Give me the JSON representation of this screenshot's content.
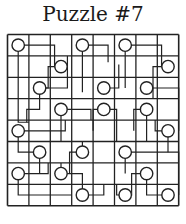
{
  "title": "Puzzle #7",
  "grid": {
    "rows": 8,
    "cols": 8,
    "x0": 7.5,
    "y0": 34.5,
    "cell": 21.4,
    "line_color": "#222222",
    "path_color": "#222222"
  },
  "circles": [
    [
      0,
      0
    ],
    [
      0,
      3
    ],
    [
      0,
      5
    ],
    [
      1,
      2
    ],
    [
      1,
      7
    ],
    [
      2,
      1
    ],
    [
      2,
      4
    ],
    [
      2,
      6
    ],
    [
      3,
      2
    ],
    [
      3,
      4
    ],
    [
      3,
      6
    ],
    [
      4,
      0
    ],
    [
      4,
      7
    ],
    [
      5,
      1
    ],
    [
      5,
      3
    ],
    [
      5,
      5
    ],
    [
      6,
      0
    ],
    [
      6,
      2
    ],
    [
      6,
      6
    ],
    [
      7,
      3
    ],
    [
      7,
      5
    ],
    [
      7,
      7
    ]
  ],
  "paths": [
    [
      [
        0,
        0
      ],
      [
        0,
        1.7
      ],
      [
        1,
        1.7
      ],
      [
        1,
        2
      ]
    ],
    [
      [
        0,
        0
      ],
      [
        3.6,
        0
      ],
      [
        3.6,
        0.5
      ]
    ],
    [
      [
        0,
        3
      ],
      [
        0,
        4.2
      ],
      [
        0.8,
        4.2
      ]
    ],
    [
      [
        0,
        3
      ],
      [
        2.2,
        3
      ]
    ],
    [
      [
        0,
        5
      ],
      [
        0,
        6.7
      ],
      [
        1,
        6.7
      ],
      [
        1,
        7
      ]
    ],
    [
      [
        0,
        5
      ],
      [
        2,
        5
      ]
    ],
    [
      [
        1,
        2
      ],
      [
        1,
        1.4
      ],
      [
        2,
        1.4
      ],
      [
        2,
        1
      ]
    ],
    [
      [
        1,
        7
      ],
      [
        1,
        6.3
      ],
      [
        2.5,
        6.3
      ]
    ],
    [
      [
        2,
        1
      ],
      [
        2,
        2.3
      ],
      [
        0.5,
        2.3
      ]
    ],
    [
      [
        2,
        1
      ],
      [
        3,
        1
      ],
      [
        3,
        0.4
      ],
      [
        3.6,
        0.4
      ]
    ],
    [
      [
        2,
        4
      ],
      [
        2,
        4.7
      ],
      [
        0.9,
        4.7
      ]
    ],
    [
      [
        2,
        6
      ],
      [
        2,
        6.3
      ]
    ],
    [
      [
        2,
        6
      ],
      [
        2,
        7.5
      ],
      [
        4,
        7.5
      ]
    ],
    [
      [
        3,
        2
      ],
      [
        3,
        3.4
      ],
      [
        3.5,
        3.4
      ]
    ],
    [
      [
        3,
        2
      ],
      [
        4.5,
        2
      ]
    ],
    [
      [
        3,
        4
      ],
      [
        3,
        3.5
      ],
      [
        4,
        3.5
      ]
    ],
    [
      [
        3,
        4
      ],
      [
        3,
        4.6
      ],
      [
        4.5,
        4.6
      ]
    ],
    [
      [
        3,
        6
      ],
      [
        3,
        5.4
      ],
      [
        4,
        5.4
      ]
    ],
    [
      [
        3,
        6
      ],
      [
        4.5,
        6
      ]
    ],
    [
      [
        4,
        0
      ],
      [
        4,
        2.2
      ],
      [
        3.5,
        2.2
      ]
    ],
    [
      [
        4,
        0
      ],
      [
        5,
        0
      ],
      [
        5,
        1
      ]
    ],
    [
      [
        4,
        7
      ],
      [
        4,
        6.4
      ],
      [
        3.5,
        6.4
      ]
    ],
    [
      [
        4,
        7
      ],
      [
        5,
        7
      ]
    ],
    [
      [
        5,
        1
      ],
      [
        6,
        1
      ]
    ],
    [
      [
        5,
        3
      ],
      [
        5,
        2.4
      ],
      [
        6,
        2.4
      ]
    ],
    [
      [
        5,
        3
      ],
      [
        4.5,
        3
      ]
    ],
    [
      [
        5,
        5
      ],
      [
        5,
        7.5
      ],
      [
        7,
        7.5
      ]
    ],
    [
      [
        5,
        5
      ],
      [
        6,
        5
      ]
    ],
    [
      [
        6,
        0
      ],
      [
        6,
        1.4
      ],
      [
        5.5,
        1.4
      ]
    ],
    [
      [
        6,
        0
      ],
      [
        7,
        0
      ],
      [
        7,
        2.5
      ]
    ],
    [
      [
        6,
        2
      ],
      [
        6,
        3
      ],
      [
        7,
        3
      ]
    ],
    [
      [
        6,
        2
      ],
      [
        5.5,
        2
      ]
    ],
    [
      [
        6,
        6
      ],
      [
        6,
        5.3
      ],
      [
        7,
        5.3
      ],
      [
        7,
        5
      ]
    ],
    [
      [
        6,
        6
      ],
      [
        7,
        6
      ],
      [
        7,
        7
      ]
    ],
    [
      [
        7,
        3
      ],
      [
        7,
        4
      ],
      [
        6.5,
        4
      ]
    ],
    [
      [
        7,
        5
      ],
      [
        7,
        4.6
      ],
      [
        6.5,
        4.6
      ]
    ]
  ]
}
